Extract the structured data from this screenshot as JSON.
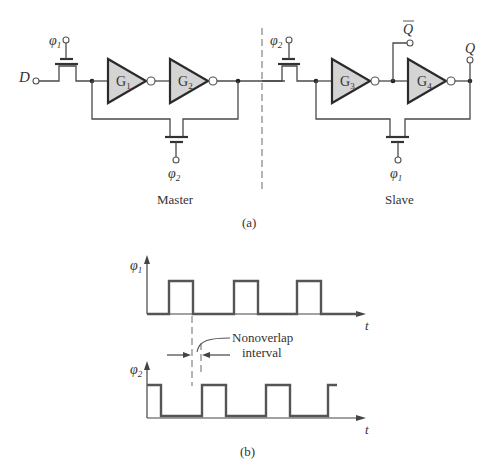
{
  "part_a": {
    "caption": "(a)",
    "master": {
      "label": "Master",
      "input_label": "D",
      "input_gate_clock": {
        "symbol": "φ",
        "sub": "1"
      },
      "feedback_gate_clock": {
        "symbol": "φ",
        "sub": "2"
      },
      "gates": [
        {
          "letter": "G",
          "sub": "1"
        },
        {
          "letter": "G",
          "sub": "2"
        }
      ]
    },
    "slave": {
      "label": "Slave",
      "input_gate_clock": {
        "symbol": "φ",
        "sub": "2"
      },
      "feedback_gate_clock": {
        "symbol": "φ",
        "sub": "1"
      },
      "gates": [
        {
          "letter": "G",
          "sub": "3"
        },
        {
          "letter": "G",
          "sub": "4"
        }
      ],
      "output_q_bar": "Q",
      "output_q": "Q"
    }
  },
  "part_b": {
    "caption": "(b)",
    "phi1": {
      "symbol": "φ",
      "sub": "1",
      "time_label": "t"
    },
    "phi2": {
      "symbol": "φ",
      "sub": "2",
      "time_label": "t"
    },
    "annotation": {
      "line1": "Nonoverlap",
      "line2": "interval"
    }
  }
}
